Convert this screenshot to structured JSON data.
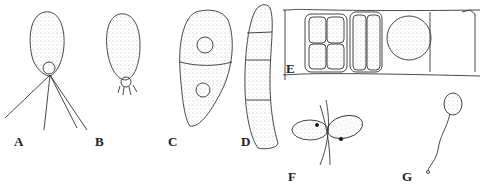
{
  "figure": {
    "panels": [
      {
        "id": "A",
        "label": "A",
        "description": "biflagellate cell, ovoid, with two long flagella"
      },
      {
        "id": "B",
        "label": "B",
        "description": "ovoid cell with short basal appendages"
      },
      {
        "id": "C",
        "label": "C",
        "description": "elongate club-shaped cell divided by one wall"
      },
      {
        "id": "D",
        "label": "D",
        "description": "elongate curved cell with four segments"
      },
      {
        "id": "E",
        "label": "E",
        "description": "filament segment with cells containing gametangia / zoospores"
      },
      {
        "id": "F",
        "label": "F",
        "description": "two fusing gametes with flagella"
      },
      {
        "id": "G",
        "label": "G",
        "description": "ovoid cell on long twisted stalk"
      }
    ],
    "colors": {
      "line": "#333333",
      "stipple": "#777777",
      "background": "#ffffff"
    }
  }
}
